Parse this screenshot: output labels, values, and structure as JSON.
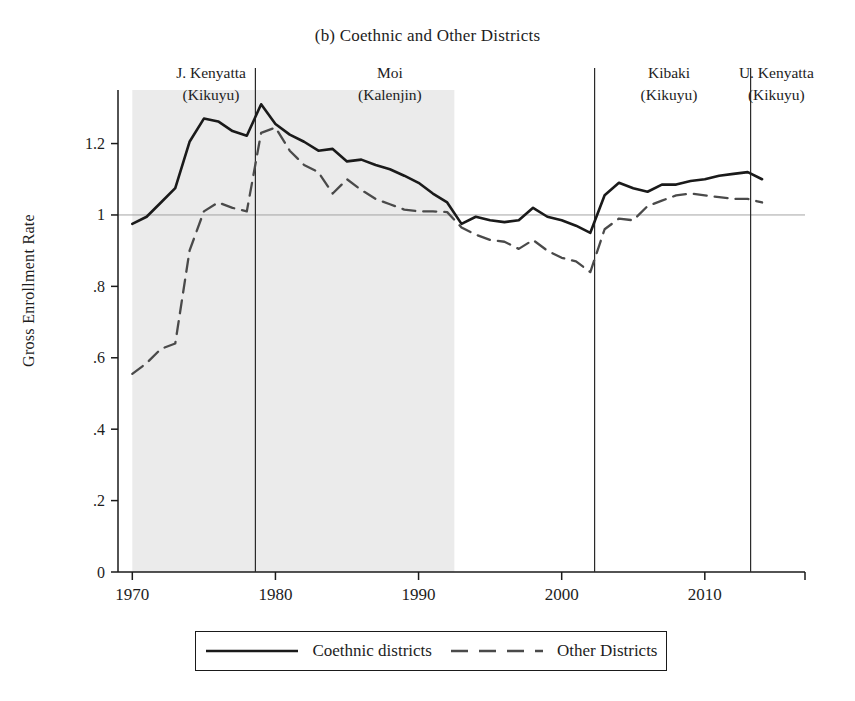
{
  "chart_data": {
    "type": "line",
    "title": "(b) Coethnic and Other Districts",
    "xlabel": "",
    "ylabel": "Gross Enrollment Rate",
    "xlim": [
      1969,
      2017
    ],
    "ylim": [
      0,
      1.35
    ],
    "ytick_labels": [
      "0",
      ".2",
      ".4",
      ".6",
      ".8",
      "1",
      "1.2"
    ],
    "ytick_values": [
      0,
      0.2,
      0.4,
      0.6,
      0.8,
      1,
      1.2
    ],
    "xtick_labels": [
      "1970",
      "1980",
      "1990",
      "2000",
      "2010"
    ],
    "xtick_values": [
      1970,
      1980,
      1990,
      2000,
      2010
    ],
    "grid": false,
    "reference_line_y": 1,
    "legend_position": "bottom",
    "shaded_region": {
      "x_start": 1970,
      "x_end": 1992.5,
      "color": "#ebebeb",
      "label": "Kenyatta and Moi coethnic era shading"
    },
    "vertical_lines": [
      1978.6,
      2002.3,
      2013.2
    ],
    "annotations": [
      {
        "name": "J. Kenyatta",
        "group": "(Kikuyu)",
        "x": 1975.5
      },
      {
        "name": "Moi",
        "group": "(Kalenjin)",
        "x": 1988.0
      },
      {
        "name": "Kibaki",
        "group": "(Kikuyu)",
        "x": 2007.5
      },
      {
        "name": "U. Kenyatta",
        "group": "(Kikuyu)",
        "x": 2015.0
      }
    ],
    "x": [
      1970,
      1971,
      1972,
      1973,
      1974,
      1975,
      1976,
      1977,
      1978,
      1979,
      1980,
      1981,
      1982,
      1983,
      1984,
      1985,
      1986,
      1987,
      1988,
      1989,
      1990,
      1991,
      1992,
      1993,
      1994,
      1995,
      1996,
      1997,
      1998,
      1999,
      2000,
      2001,
      2002,
      2003,
      2004,
      2005,
      2006,
      2007,
      2008,
      2009,
      2010,
      2011,
      2012,
      2013,
      2014
    ],
    "series": [
      {
        "name": "Coethnic districts",
        "style": "solid",
        "color": "#1a1a1a",
        "values": [
          0.975,
          0.995,
          1.035,
          1.075,
          1.205,
          1.27,
          1.262,
          1.235,
          1.222,
          1.31,
          1.255,
          1.225,
          1.205,
          1.18,
          1.185,
          1.15,
          1.155,
          1.14,
          1.128,
          1.11,
          1.09,
          1.06,
          1.035,
          0.975,
          0.995,
          0.985,
          0.98,
          0.985,
          1.02,
          0.995,
          0.985,
          0.97,
          0.95,
          1.055,
          1.09,
          1.075,
          1.065,
          1.085,
          1.085,
          1.095,
          1.1,
          1.11,
          1.115,
          1.12,
          1.1
        ]
      },
      {
        "name": "Other Districts",
        "style": "dashed",
        "color": "#4a4a4a",
        "values": [
          0.555,
          0.585,
          0.625,
          0.64,
          0.9,
          1.01,
          1.035,
          1.02,
          1.01,
          1.23,
          1.245,
          1.18,
          1.14,
          1.12,
          1.06,
          1.1,
          1.07,
          1.045,
          1.03,
          1.015,
          1.01,
          1.01,
          1.008,
          0.965,
          0.945,
          0.93,
          0.925,
          0.905,
          0.93,
          0.9,
          0.88,
          0.87,
          0.84,
          0.96,
          0.99,
          0.985,
          1.025,
          1.04,
          1.055,
          1.06,
          1.055,
          1.05,
          1.045,
          1.045,
          1.035
        ]
      }
    ]
  },
  "legend": {
    "entries": [
      {
        "label": "Coethnic districts",
        "style": "solid"
      },
      {
        "label": "Other Districts",
        "style": "dashed"
      }
    ]
  }
}
